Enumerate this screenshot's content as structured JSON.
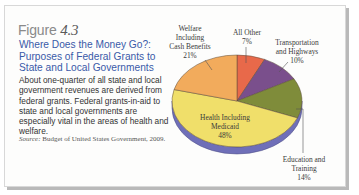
{
  "figure": {
    "label": "Figure",
    "number": "4.3",
    "title": "Where Does the Money Go?: Purposes of Federal Grants to State and Local Governments",
    "description": "About one-quarter of all state and local government revenues are derived from federal grants. Federal grants-in-aid to state and local governments are especially vital in the areas of health and welfare.",
    "source_label": "Source:",
    "source_text": "Budget of United States Government, 2009."
  },
  "chart_data": {
    "type": "pie",
    "title": "Where Does the Money Go?: Purposes of Federal Grants to State and Local Governments",
    "order": "clockwise from top",
    "slices": [
      {
        "label": "All Other",
        "value": 7,
        "value_label": "7%",
        "color": "#e8694a"
      },
      {
        "label": "Transportation and Highways",
        "value": 10,
        "value_label": "10%",
        "color": "#7a4f8c"
      },
      {
        "label": "Education and Training",
        "value": 14,
        "value_label": "14%",
        "color": "#7f8c3a"
      },
      {
        "label": "Health Including Medicaid",
        "value": 48,
        "value_label": "48%",
        "color": "#f0df6a"
      },
      {
        "label": "Welfare Including Cash Benefits",
        "value": 21,
        "value_label": "21%",
        "color": "#f2ab5c"
      }
    ],
    "labels_text": {
      "welfare": [
        "Welfare",
        "Including",
        "Cash Benefits",
        "21%"
      ],
      "other": [
        "All Other",
        "7%"
      ],
      "transport": [
        "Transportation",
        "and Highways",
        "10%"
      ],
      "health": [
        "Health Including",
        "Medicaid",
        "48%"
      ],
      "education": [
        "Education and",
        "Training",
        "14%"
      ]
    },
    "edge_color": "#6f6fb8"
  }
}
